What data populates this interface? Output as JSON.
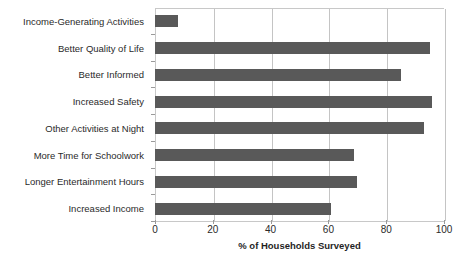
{
  "chart_data": {
    "type": "bar",
    "orientation": "horizontal",
    "title": "",
    "subtitle": "",
    "xlabel": "% of Households Surveyed",
    "ylabel": "",
    "xlim": [
      0,
      100
    ],
    "xticks": [
      0,
      20,
      40,
      60,
      80,
      100
    ],
    "xtick_labels": [
      "0",
      "20",
      "40",
      "60",
      "80",
      "100"
    ],
    "grid": true,
    "grid_axis": "x",
    "legend": false,
    "legend_position": "none",
    "bar_color": "#595959",
    "categories": [
      "Income-Generating Activities",
      "Better Quality of Life",
      "Better Informed",
      "Increased Safety",
      "Other Activities at Night",
      "More Time for Schoolwork",
      "Longer Entertainment Hours",
      "Increased Income"
    ],
    "values": [
      8,
      95,
      85,
      96,
      93,
      69,
      70,
      61
    ]
  }
}
